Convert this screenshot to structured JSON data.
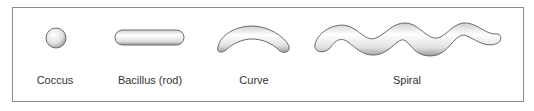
{
  "diagram": {
    "shapes": [
      {
        "name": "Coccus",
        "label": "Coccus"
      },
      {
        "name": "Bacillus",
        "label": "Bacillus (rod)"
      },
      {
        "name": "Curve",
        "label": "Curve"
      },
      {
        "name": "Spiral",
        "label": "Spiral"
      }
    ],
    "colors": {
      "outline": "#6a6a6a",
      "fill_light": "#ffffff",
      "fill_dark": "#b0b0b0",
      "border": "#8a8a8a",
      "text": "#333333"
    }
  }
}
